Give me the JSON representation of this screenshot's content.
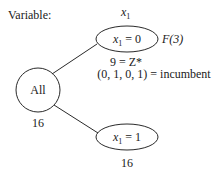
{
  "header": {
    "label": "Variable:",
    "variable": "x",
    "variable_sub": "1"
  },
  "tree": {
    "root": {
      "label": "All",
      "bound": "16"
    },
    "branch_top": {
      "var": "x",
      "var_sub": "1",
      "relation": " = 0",
      "status": "F(3)",
      "value_line": "9 = Z*",
      "incumbent_line": "(0, 1, 0, 1) = incumbent"
    },
    "branch_bottom": {
      "var": "x",
      "var_sub": "1",
      "relation": " = 1",
      "bound": "16"
    }
  },
  "colors": {
    "stroke": "#2a2a2a",
    "text": "#1a1a1a",
    "background": "#ffffff"
  }
}
